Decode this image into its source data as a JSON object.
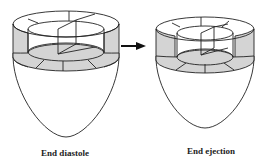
{
  "figure": {
    "colors": {
      "stroke": "#222222",
      "segment_fill": "#d4d4d4",
      "background": "#ffffff"
    },
    "panels": [
      {
        "id": "diastole",
        "label": "End diastole"
      },
      {
        "id": "ejection",
        "label": "End ejection"
      }
    ],
    "arrow": {
      "direction": "right",
      "from": "End diastole",
      "to": "End ejection"
    }
  }
}
